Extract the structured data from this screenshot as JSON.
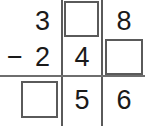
{
  "problem": {
    "type": "vertical-subtraction",
    "operator": "−",
    "minuend": {
      "hundreds": "3",
      "tens": "",
      "ones": "8"
    },
    "subtrahend": {
      "hundreds": "2",
      "tens": "4",
      "ones": ""
    },
    "difference": {
      "hundreds": "",
      "tens": "5",
      "ones": "6"
    }
  },
  "rows": {
    "row1": {
      "operator": "",
      "col1": "3",
      "col2": "",
      "col3": "8"
    },
    "row2": {
      "operator": "−",
      "col1": "2",
      "col2": "4",
      "col3": ""
    },
    "row3": {
      "operator": "",
      "col1": "",
      "col2": "5",
      "col3": "6"
    }
  },
  "answer_boxes": [
    {
      "id": "box-top-middle",
      "value": "",
      "row": 1,
      "column": 2
    },
    {
      "id": "box-middle-right",
      "value": "",
      "row": 2,
      "column": 3
    },
    {
      "id": "box-bottom-left",
      "value": "",
      "row": 3,
      "column": 1
    }
  ],
  "colors": {
    "digit": "#1a1a1a",
    "rule": "#5a5a5a",
    "box_border": "#5a5a5a",
    "background": "#ffffff"
  }
}
